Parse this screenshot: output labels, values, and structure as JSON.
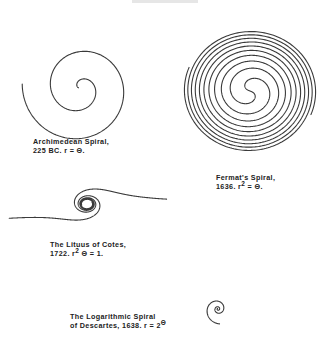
{
  "figure": {
    "header_fragment": "",
    "spirals": [
      {
        "id": "archimedean",
        "name": "Archimedean Spiral",
        "caption": {
          "line1": "Archimedean Spiral,",
          "line2_prefix": "225  BC.   r = Θ.",
          "exponent": "",
          "line2_suffix": ""
        },
        "equation": "r = Θ",
        "year": "225 BC",
        "geometry": {
          "cx": 80,
          "cy": 88,
          "turns": 2.05,
          "r_max": 58,
          "start_angle_deg": 185
        }
      },
      {
        "id": "fermat",
        "name": "Fermat's Spiral",
        "caption": {
          "line1": "Fermat's  Spiral,",
          "line2_prefix": "1636.   r",
          "exponent": "2",
          "line2_suffix": "  = Θ."
        },
        "equation": "r² = Θ",
        "year": "1636",
        "geometry": {
          "cx": 250,
          "cy": 91,
          "turns": 5.0,
          "r_max": 66,
          "yscale": 0.93
        }
      },
      {
        "id": "lituus",
        "name": "The Lituus of Cotes",
        "caption": {
          "line1": "The  Lituus  of  Cotes,",
          "line2_prefix": "1722.   r",
          "exponent": "2",
          "line2_suffix": " Θ  = 1."
        },
        "equation": "r²Θ = 1",
        "year": "1722",
        "geometry": {
          "cx": 87,
          "cy": 204,
          "k": 22,
          "theta_min": 0.055,
          "theta_max": 16
        }
      },
      {
        "id": "logarithmic",
        "name": "The Logarithmic Spiral",
        "caption": {
          "line1": "The  Logarithmic  Spiral",
          "line2_prefix": "of  Descartes,  1638.   r  =  2",
          "exponent": "Θ",
          "line2_suffix": ""
        },
        "equation": "r = 2^Θ",
        "year": "1638",
        "geometry": {
          "cx": 218,
          "cy": 309,
          "a": 1.6,
          "b": 0.2,
          "theta_max": 17.7
        }
      }
    ]
  }
}
